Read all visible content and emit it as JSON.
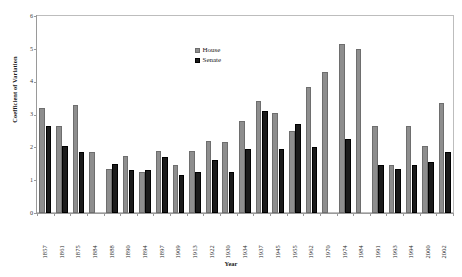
{
  "chart_data": {
    "type": "bar",
    "title": "",
    "xlabel": "Year",
    "ylabel": "Coefficient of Variation",
    "ylim": [
      0,
      6
    ],
    "yticks": [
      0,
      1,
      2,
      3,
      4,
      5,
      6
    ],
    "grid": false,
    "legend_position": "top-center",
    "categories": [
      "1857",
      "1861",
      "1875",
      "1884",
      "1888",
      "1890",
      "1894",
      "1897",
      "1909",
      "1913",
      "1922",
      "1930",
      "1934",
      "1937",
      "1945",
      "1955",
      "1962",
      "1970",
      "1974",
      "1984",
      "1991",
      "1993",
      "1994",
      "2000",
      "2002"
    ],
    "series": [
      {
        "name": "House",
        "color": "#8e8e8e",
        "values": [
          3.2,
          2.65,
          3.3,
          1.85,
          1.35,
          1.75,
          1.25,
          1.9,
          1.45,
          1.9,
          2.2,
          2.15,
          2.8,
          3.4,
          3.05,
          2.5,
          3.85,
          4.3,
          5.15,
          5.0,
          2.65,
          1.45,
          2.65,
          2.05,
          3.35
        ]
      },
      {
        "name": "Senate",
        "color": "#1b1b1b",
        "values": [
          2.65,
          2.05,
          1.85,
          0,
          1.5,
          1.3,
          1.3,
          1.7,
          1.15,
          1.25,
          1.6,
          1.25,
          1.95,
          3.1,
          1.95,
          2.7,
          2.0,
          0,
          2.25,
          0,
          1.45,
          1.35,
          1.45,
          1.55,
          1.85
        ]
      }
    ]
  },
  "legend": {
    "entries": [
      {
        "label": "House",
        "swatch": "house-swatch"
      },
      {
        "label": "Senate",
        "swatch": "senate-swatch"
      }
    ]
  },
  "axes": {
    "y_title": "Coefficient of Variation",
    "x_title": "Year"
  }
}
